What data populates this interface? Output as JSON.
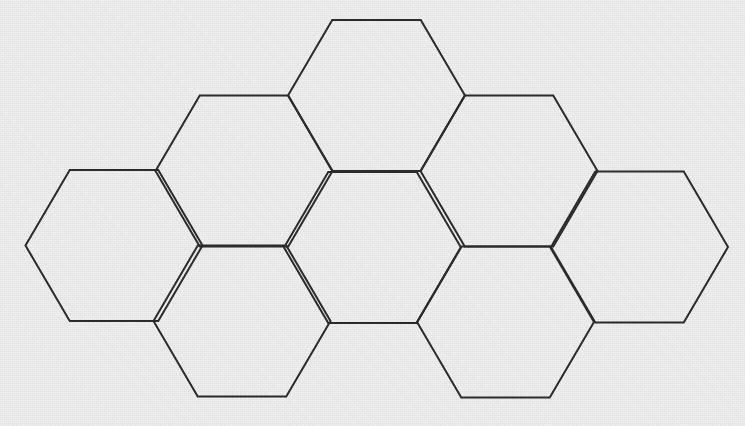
{
  "figure": {
    "canvas": {
      "width": 745,
      "height": 426
    },
    "background_color": "#efefef",
    "stroke_color": "#2b2b2b",
    "stroke_width": 2,
    "fill_color": "none",
    "hex_orientation": "flat-top",
    "hex_count": 7,
    "geometry": {
      "circumradius": 88.5,
      "flat_edge_length": 88.5,
      "half_height": 75.5,
      "column_spacing": 132.5,
      "row_spacing": 151.5
    },
    "cells": [
      {
        "name": "top-center",
        "cx": 376.5,
        "cy": 95.5
      },
      {
        "name": "upper-left",
        "cx": 244.0,
        "cy": 171.0
      },
      {
        "name": "upper-right",
        "cx": 509.0,
        "cy": 171.0
      },
      {
        "name": "middle-left",
        "cx": 114.0,
        "cy": 245.5
      },
      {
        "name": "middle-center",
        "cx": 372.5,
        "cy": 247.5
      },
      {
        "name": "middle-right",
        "cx": 639.5,
        "cy": 247.0
      },
      {
        "name": "lower-left",
        "cx": 242.0,
        "cy": 321.0
      },
      {
        "name": "lower-right",
        "cx": 505.5,
        "cy": 322.0
      }
    ]
  }
}
